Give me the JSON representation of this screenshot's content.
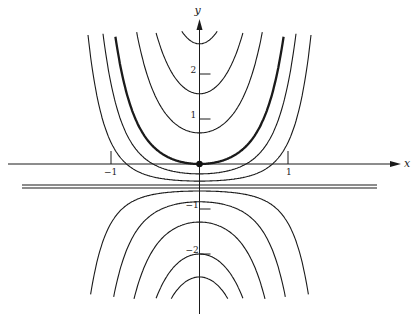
{
  "figure": {
    "axes": {
      "x_label": "x",
      "y_label": "y",
      "x_ticks": [
        {
          "value": -1,
          "label": "−1"
        },
        {
          "value": 1,
          "label": "1"
        }
      ],
      "y_ticks": [
        {
          "value": 2,
          "label": "2"
        },
        {
          "value": 1,
          "label": "1"
        },
        {
          "value": -1,
          "label": "−1"
        },
        {
          "value": -2,
          "label": "−2"
        }
      ]
    },
    "mapping": {
      "origin_px": [
        199.5,
        164
      ],
      "x_unit_px": 88.5,
      "y_unit_px": 45,
      "clip_top_px": 31,
      "clip_bottom_px": 299
    },
    "asymptote": {
      "y": -0.5,
      "label": ""
    },
    "curve_family": {
      "k": 2.1,
      "offset": -0.5
    },
    "curves": [
      {
        "y_intercept": 2.67,
        "thick": false
      },
      {
        "y_intercept": 1.56,
        "thick": false
      },
      {
        "y_intercept": 0.69,
        "thick": false
      },
      {
        "y_intercept": 0.0,
        "thick": true
      },
      {
        "y_intercept": -0.22,
        "thick": false
      },
      {
        "y_intercept": -0.38,
        "thick": false
      },
      {
        "y_intercept": -0.6,
        "thick": false
      },
      {
        "y_intercept": -0.84,
        "thick": false
      },
      {
        "y_intercept": -1.29,
        "thick": false
      },
      {
        "y_intercept": -2.0,
        "thick": false
      },
      {
        "y_intercept": -2.51,
        "thick": false
      }
    ],
    "marked_point": {
      "x": 0,
      "y": 0
    },
    "colors": {
      "ink": "#1a1a1a",
      "background": "#ffffff"
    }
  }
}
